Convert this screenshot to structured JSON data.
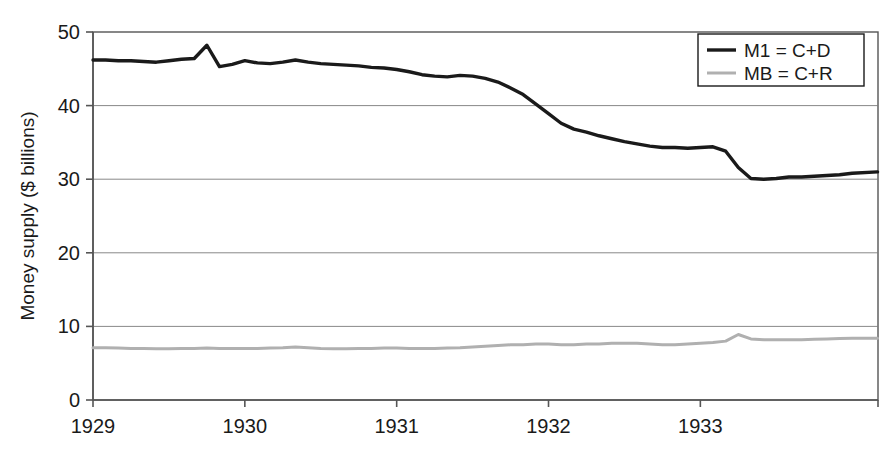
{
  "chart_data": {
    "type": "line",
    "title": "",
    "subtitle": "",
    "xlabel": "",
    "ylabel": "Money supply ($ billions)",
    "xlim": [
      1929.0,
      1934.17
    ],
    "ylim": [
      0,
      50
    ],
    "yticks": [
      0,
      10,
      20,
      30,
      40,
      50
    ],
    "ytick_labels": [
      "0",
      "10",
      "20",
      "30",
      "40",
      "50"
    ],
    "xticks": [
      1929,
      1930,
      1931,
      1932,
      1933
    ],
    "xtick_labels": [
      "1929",
      "1930",
      "1931",
      "1932",
      "1933"
    ],
    "grid": "horizontal",
    "grid_color": "#7a7a7a",
    "frame": true,
    "legend_position": "top-right",
    "legend_entries": [
      "M1 = C+D",
      "MB = C+R"
    ],
    "annotations": [],
    "series": [
      {
        "name": "M1 = C+D",
        "color": "#1a1a1a",
        "line_width": 3.4,
        "x": [
          1929.0,
          1929.083,
          1929.167,
          1929.25,
          1929.333,
          1929.417,
          1929.5,
          1929.583,
          1929.667,
          1929.75,
          1929.833,
          1929.917,
          1930.0,
          1930.083,
          1930.167,
          1930.25,
          1930.333,
          1930.417,
          1930.5,
          1930.583,
          1930.667,
          1930.75,
          1930.833,
          1930.917,
          1931.0,
          1931.083,
          1931.167,
          1931.25,
          1931.333,
          1931.417,
          1931.5,
          1931.583,
          1931.667,
          1931.75,
          1931.833,
          1931.917,
          1932.0,
          1932.083,
          1932.167,
          1932.25,
          1932.333,
          1932.417,
          1932.5,
          1932.583,
          1932.667,
          1932.75,
          1932.833,
          1932.917,
          1933.0,
          1933.083,
          1933.167,
          1933.25,
          1933.333,
          1933.417,
          1933.5,
          1933.583,
          1933.667,
          1933.75,
          1933.833,
          1933.917,
          1934.0,
          1934.167
        ],
        "values": [
          46.2,
          46.2,
          46.1,
          46.1,
          46.0,
          45.9,
          46.1,
          46.3,
          46.4,
          48.2,
          45.3,
          45.6,
          46.1,
          45.8,
          45.7,
          45.9,
          46.2,
          45.9,
          45.7,
          45.6,
          45.5,
          45.4,
          45.2,
          45.1,
          44.9,
          44.6,
          44.2,
          44.0,
          43.9,
          44.1,
          44.0,
          43.7,
          43.2,
          42.4,
          41.5,
          40.2,
          38.9,
          37.6,
          36.8,
          36.4,
          35.9,
          35.5,
          35.1,
          34.8,
          34.5,
          34.3,
          34.3,
          34.2,
          34.3,
          34.4,
          33.8,
          31.6,
          30.1,
          30.0,
          30.1,
          30.3,
          30.3,
          30.4,
          30.5,
          30.6,
          30.8,
          31.0
        ]
      },
      {
        "name": "MB = C+R",
        "color": "#b0b0b0",
        "line_width": 3.0,
        "x": [
          1929.0,
          1929.083,
          1929.167,
          1929.25,
          1929.333,
          1929.417,
          1929.5,
          1929.583,
          1929.667,
          1929.75,
          1929.833,
          1929.917,
          1930.0,
          1930.083,
          1930.167,
          1930.25,
          1930.333,
          1930.417,
          1930.5,
          1930.583,
          1930.667,
          1930.75,
          1930.833,
          1930.917,
          1931.0,
          1931.083,
          1931.167,
          1931.25,
          1931.333,
          1931.417,
          1931.5,
          1931.583,
          1931.667,
          1931.75,
          1931.833,
          1931.917,
          1932.0,
          1932.083,
          1932.167,
          1932.25,
          1932.333,
          1932.417,
          1932.5,
          1932.583,
          1932.667,
          1932.75,
          1932.833,
          1932.917,
          1933.0,
          1933.083,
          1933.167,
          1933.25,
          1933.333,
          1933.417,
          1933.5,
          1933.583,
          1933.667,
          1933.75,
          1933.833,
          1933.917,
          1934.0,
          1934.167
        ],
        "values": [
          7.1,
          7.1,
          7.05,
          7.0,
          7.0,
          6.95,
          6.95,
          7.0,
          7.0,
          7.05,
          7.0,
          7.0,
          7.0,
          7.0,
          7.05,
          7.1,
          7.2,
          7.1,
          7.0,
          6.95,
          6.95,
          7.0,
          7.0,
          7.05,
          7.05,
          7.0,
          7.0,
          7.0,
          7.05,
          7.1,
          7.2,
          7.3,
          7.4,
          7.5,
          7.5,
          7.6,
          7.6,
          7.5,
          7.5,
          7.6,
          7.6,
          7.7,
          7.7,
          7.7,
          7.6,
          7.5,
          7.5,
          7.6,
          7.7,
          7.8,
          8.0,
          8.9,
          8.3,
          8.2,
          8.2,
          8.2,
          8.2,
          8.25,
          8.3,
          8.35,
          8.4,
          8.4
        ]
      }
    ]
  },
  "plot_geometry": {
    "left": 93,
    "right": 878,
    "top": 32,
    "bottom": 400
  },
  "legend_box": {
    "x": 698,
    "y": 34,
    "width": 166,
    "height": 52
  }
}
